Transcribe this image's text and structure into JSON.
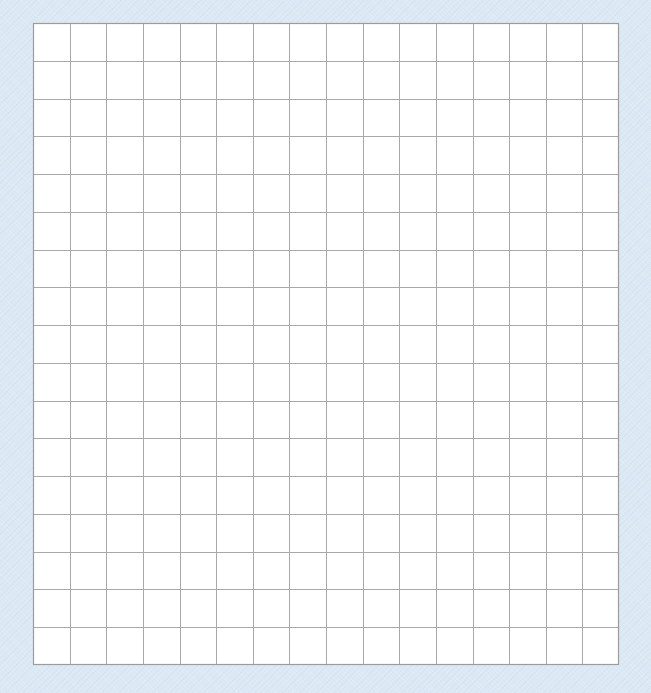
{
  "worksheet": {
    "type": "blank graph paper grid",
    "grid": {
      "columns": 16,
      "rows": 17,
      "cell_fill": "#ffffff",
      "line_color": "#a9a9a9",
      "border_color": "#9c9c9c"
    },
    "background_color": "#dce9f5"
  }
}
